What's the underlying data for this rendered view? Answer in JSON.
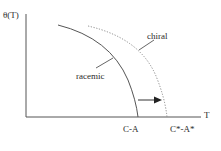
{
  "diagram": {
    "y_axis_label": "θ(T)",
    "x_axis_label": "T",
    "curves": [
      {
        "name": "racemic",
        "style": "solid",
        "label": "racemic"
      },
      {
        "name": "chiral",
        "style": "dotted",
        "label": "chiral"
      }
    ],
    "x_ticks": [
      {
        "label": "C-A"
      },
      {
        "label": "C*-A*"
      }
    ],
    "arrow": {
      "direction": "right",
      "meaning": "shift from C-A to C*-A*"
    },
    "colors": {
      "line": "#4a4a4a",
      "text": "#2a2a2a",
      "background": "#ffffff"
    }
  }
}
